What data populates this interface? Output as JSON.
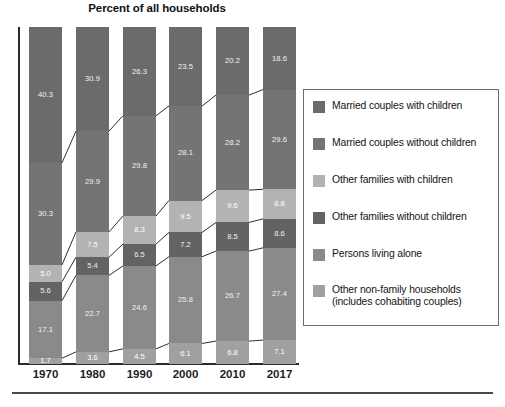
{
  "chart_data": {
    "type": "bar",
    "subtype": "100% stacked column",
    "title": "Percent of all households",
    "xlabel": "",
    "ylabel": "",
    "ylim": [
      0,
      100
    ],
    "grid": false,
    "legend_position": "right",
    "categories": [
      "1970",
      "1980",
      "1990",
      "2000",
      "2010",
      "2017"
    ],
    "series": [
      {
        "name": "Married couples with children",
        "color": "#6b6b6b",
        "values": [
          40.3,
          30.9,
          26.3,
          23.5,
          20.2,
          18.6
        ]
      },
      {
        "name": "Married couples without children",
        "color": "#747474",
        "values": [
          30.3,
          29.9,
          29.8,
          28.1,
          28.2,
          29.6
        ]
      },
      {
        "name": "Other families with children",
        "color": "#b3b3b3",
        "values": [
          5.0,
          7.5,
          8.3,
          9.5,
          9.6,
          8.8
        ]
      },
      {
        "name": "Other families without children",
        "color": "#636363",
        "values": [
          5.6,
          5.4,
          6.5,
          7.2,
          8.5,
          8.6
        ]
      },
      {
        "name": "Persons living alone",
        "color": "#8a8a8a",
        "values": [
          17.1,
          22.7,
          24.6,
          25.8,
          26.7,
          27.4
        ]
      },
      {
        "name": "Other non-family households (includes cohabiting couples)",
        "color": "#a0a0a0",
        "values": [
          1.7,
          3.6,
          4.5,
          6.1,
          6.8,
          7.1
        ]
      }
    ]
  },
  "legend": {
    "items": [
      {
        "label": "Married couples with children",
        "color": "#6b6b6b"
      },
      {
        "label": "Married couples without children",
        "color": "#747474"
      },
      {
        "label": "Other families with children",
        "color": "#b3b3b3"
      },
      {
        "label": "Other families without children",
        "color": "#636363"
      },
      {
        "label": "Persons living alone",
        "color": "#8a8a8a"
      },
      {
        "label": "Other non-family households (includes cohabiting couples)",
        "color": "#a0a0a0"
      }
    ]
  },
  "axis": {
    "tick_labels": [
      "1970",
      "1980",
      "1990",
      "2000",
      "2010",
      "2017"
    ]
  }
}
